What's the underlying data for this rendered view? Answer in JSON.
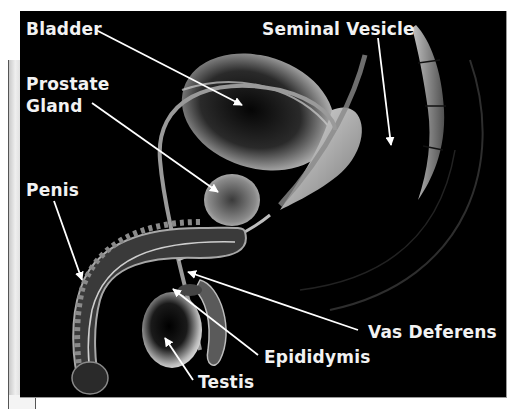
{
  "diagram": {
    "background_color": "#000000",
    "label_color": "#f2f2f2",
    "labels": {
      "bladder": "Bladder",
      "seminal_vesicle": "Seminal Vesicle",
      "prostate_line1": "Prostate",
      "prostate_line2": "Gland",
      "penis": "Penis",
      "vas_deferens": "Vas Deferens",
      "epididymis": "Epididymis",
      "testis": "Testis"
    },
    "structures": [
      "bladder",
      "seminal vesicle",
      "prostate gland",
      "penis",
      "vas deferens",
      "epididymis",
      "testis",
      "rectum",
      "spine"
    ]
  }
}
